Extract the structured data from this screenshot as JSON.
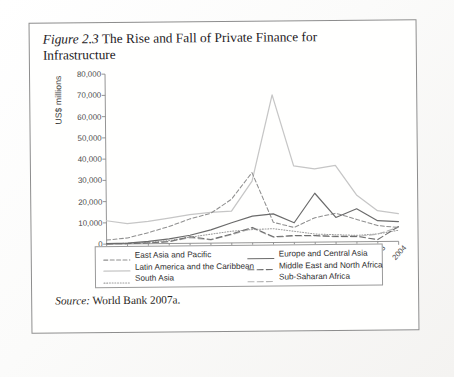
{
  "figure": {
    "label": "Figure 2.3",
    "title": " The Rise and Fall of Private Finance for Infrastructure",
    "source_prefix": "Source:",
    "source_text": " World Bank 2007a."
  },
  "chart_data": {
    "type": "line",
    "title": "The Rise and Fall of Private Finance for Infrastructure",
    "xlabel": "",
    "ylabel": "US$ millions",
    "categories": [
      "1990",
      "1991",
      "1992",
      "1993",
      "1994",
      "1995",
      "1996",
      "1997",
      "1998",
      "1999",
      "2000",
      "2001",
      "2002",
      "2003",
      "2004"
    ],
    "ytick_labels": [
      "0",
      "10,000",
      "20,000",
      "30,000",
      "40,000",
      "50,000",
      "60,000",
      "70,000",
      "80,000"
    ],
    "ytick_values": [
      0,
      10000,
      20000,
      30000,
      40000,
      50000,
      60000,
      70000,
      80000
    ],
    "ylim": [
      0,
      80000
    ],
    "grid": false,
    "legend_position": "below-axes",
    "series": [
      {
        "name": "East Asia and Pacific",
        "style": "dashed",
        "color": "#8f8f8f",
        "values": [
          1900,
          2800,
          5200,
          8000,
          11500,
          14000,
          20500,
          33000,
          9500,
          7000,
          11500,
          13500,
          10500,
          7500,
          6500
        ]
      },
      {
        "name": "Latin America and the Caribbean",
        "style": "solid-light",
        "color": "#c6c6c6",
        "values": [
          11000,
          9500,
          10500,
          12000,
          13500,
          14500,
          15000,
          29000,
          69500,
          36000,
          34500,
          36000,
          22000,
          14500,
          13000
        ]
      },
      {
        "name": "South Asia",
        "style": "dotted",
        "color": "#9d9d9d",
        "values": [
          150,
          300,
          700,
          1400,
          2900,
          4200,
          5500,
          6200,
          6500,
          5200,
          3800,
          3400,
          3000,
          3600,
          5200
        ]
      },
      {
        "name": "Europe and Central Asia",
        "style": "solid-dark",
        "color": "#6b6b6b",
        "values": [
          250,
          400,
          1100,
          2200,
          3800,
          6200,
          9500,
          12500,
          13500,
          9200,
          23000,
          11500,
          15500,
          9800,
          9300
        ]
      },
      {
        "name": "Middle East and North Africa",
        "style": "dash-dash",
        "color": "#6f6f6f",
        "values": [
          100,
          180,
          350,
          900,
          3100,
          1700,
          4200,
          7200,
          2700,
          3200,
          3100,
          2600,
          2500,
          900,
          7000
        ]
      },
      {
        "name": "Sub-Saharan Africa",
        "style": "dash-light",
        "color": "#b4b4b4",
        "values": [
          80,
          150,
          400,
          900,
          2600,
          1500,
          3900,
          6800,
          2500,
          3000,
          2900,
          2400,
          2400,
          3500,
          6600
        ]
      }
    ]
  },
  "legend": {
    "left": [
      {
        "label": "East Asia and Pacific",
        "style": "dashed",
        "color": "#8f8f8f"
      },
      {
        "label": "Latin America and the Caribbean",
        "style": "solid-light",
        "color": "#c6c6c6"
      },
      {
        "label": "South Asia",
        "style": "dotted",
        "color": "#9d9d9d"
      }
    ],
    "right": [
      {
        "label": "Europe and Central Asia",
        "style": "solid-dark",
        "color": "#6b6b6b"
      },
      {
        "label": "Middle East and North Africa",
        "style": "dash-dash",
        "color": "#6f6f6f"
      },
      {
        "label": "Sub-Saharan Africa",
        "style": "dash-light",
        "color": "#b4b4b4"
      }
    ]
  }
}
